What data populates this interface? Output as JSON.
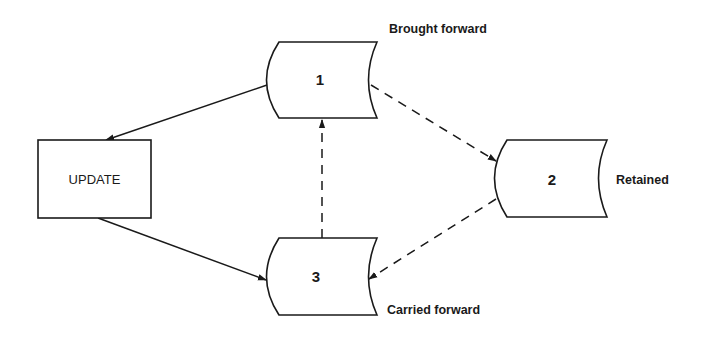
{
  "diagram": {
    "type": "file-update-flow",
    "process": {
      "id": "update",
      "label": "UPDATE"
    },
    "files": [
      {
        "id": "f1",
        "number": "1",
        "caption": "Brought forward"
      },
      {
        "id": "f2",
        "number": "2",
        "caption": "Retained"
      },
      {
        "id": "f3",
        "number": "3",
        "caption": "Carried forward"
      }
    ],
    "edges": [
      {
        "from": "f1",
        "to": "update",
        "style": "solid"
      },
      {
        "from": "update",
        "to": "f3",
        "style": "solid"
      },
      {
        "from": "f1",
        "to": "f2",
        "style": "dashed"
      },
      {
        "from": "f2",
        "to": "f3",
        "style": "dashed"
      },
      {
        "from": "f3",
        "to": "f1",
        "style": "dashed"
      }
    ],
    "colors": {
      "ink": "#1a1a1a",
      "background": "#ffffff"
    }
  }
}
